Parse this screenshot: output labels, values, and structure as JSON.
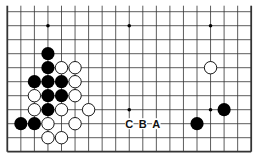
{
  "diagram": {
    "type": "go-board-partial",
    "columns": 19,
    "rows_shown": 11,
    "edges": {
      "left": true,
      "right": true,
      "bottom": true,
      "top": false
    },
    "grid": {
      "x0": 7.3,
      "dx": 13.55,
      "y0": 11.7,
      "dy": 14.0
    },
    "star_points": [
      {
        "col": 3,
        "row": 1
      },
      {
        "col": 9,
        "row": 1
      },
      {
        "col": 15,
        "row": 1
      },
      {
        "col": 9,
        "row": 7
      },
      {
        "col": 15,
        "row": 7
      }
    ],
    "stones": [
      {
        "color": "black",
        "col": 3,
        "row": 3
      },
      {
        "color": "black",
        "col": 3,
        "row": 4
      },
      {
        "color": "white",
        "col": 4,
        "row": 4
      },
      {
        "color": "white",
        "col": 5,
        "row": 4
      },
      {
        "color": "white",
        "col": 15,
        "row": 4
      },
      {
        "color": "black",
        "col": 2,
        "row": 5
      },
      {
        "color": "black",
        "col": 3,
        "row": 5
      },
      {
        "color": "black",
        "col": 4,
        "row": 5
      },
      {
        "color": "white",
        "col": 5,
        "row": 5
      },
      {
        "color": "white",
        "col": 2,
        "row": 6
      },
      {
        "color": "black",
        "col": 3,
        "row": 6
      },
      {
        "color": "black",
        "col": 4,
        "row": 6
      },
      {
        "color": "white",
        "col": 5,
        "row": 6
      },
      {
        "color": "white",
        "col": 2,
        "row": 7
      },
      {
        "color": "black",
        "col": 3,
        "row": 7
      },
      {
        "color": "white",
        "col": 4,
        "row": 7
      },
      {
        "color": "white",
        "col": 6,
        "row": 7
      },
      {
        "color": "black",
        "col": 16,
        "row": 7
      },
      {
        "color": "black",
        "col": 1,
        "row": 8
      },
      {
        "color": "black",
        "col": 2,
        "row": 8
      },
      {
        "color": "white",
        "col": 3,
        "row": 8
      },
      {
        "color": "white",
        "col": 5,
        "row": 8
      },
      {
        "color": "black",
        "col": 14,
        "row": 8
      },
      {
        "color": "white",
        "col": 3,
        "row": 9
      },
      {
        "color": "white",
        "col": 4,
        "row": 9
      }
    ],
    "labels": [
      {
        "text": "C",
        "col": 9,
        "row": 8
      },
      {
        "text": "B",
        "col": 10,
        "row": 8
      },
      {
        "text": "A",
        "col": 11,
        "row": 8
      }
    ],
    "colors": {
      "line": "#333333",
      "black_stone": "#000000",
      "white_stone": "#ffffff",
      "background": "#ffffff"
    }
  }
}
